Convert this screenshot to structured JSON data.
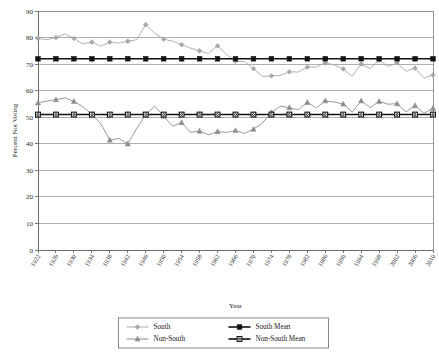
{
  "chart_data": {
    "type": "line",
    "title": "",
    "xlabel": "Year",
    "ylabel": "Percent Not Voting",
    "ylim": [
      0,
      90
    ],
    "ytick_step": 10,
    "yticks": [
      0,
      10,
      20,
      30,
      40,
      50,
      60,
      70,
      80,
      90
    ],
    "grid": true,
    "legend_position": "bottom",
    "xlim": [
      1922,
      2010
    ],
    "x": [
      1922,
      1924,
      1926,
      1928,
      1930,
      1932,
      1934,
      1936,
      1938,
      1940,
      1942,
      1944,
      1946,
      1948,
      1950,
      1952,
      1954,
      1956,
      1958,
      1960,
      1962,
      1964,
      1966,
      1968,
      1970,
      1972,
      1974,
      1976,
      1978,
      1980,
      1982,
      1984,
      1986,
      1988,
      1990,
      1992,
      1994,
      1996,
      1998,
      2000,
      2002,
      2004,
      2006,
      2008,
      2010
    ],
    "xtick_labels": [
      "1922",
      "1926",
      "1930",
      "1934",
      "1938",
      "1942",
      "1946",
      "1950",
      "1954",
      "1958",
      "1962",
      "1966",
      "1970",
      "1974",
      "1978",
      "1982",
      "1986",
      "1990",
      "1994",
      "1998",
      "2002",
      "2006",
      "2010"
    ],
    "series": [
      {
        "name": "South",
        "color": "#a8a8a8",
        "marker": "diamond",
        "values": [
          79.6,
          79.2,
          80.0,
          81.4,
          79.7,
          77.6,
          78.3,
          76.7,
          78.3,
          77.9,
          78.6,
          79.2,
          84.9,
          81.6,
          79.4,
          78.6,
          77.3,
          76.0,
          75.0,
          74.0,
          76.9,
          73.7,
          71.1,
          70.9,
          68.3,
          65.3,
          65.6,
          65.7,
          67.1,
          67.0,
          68.9,
          68.9,
          70.5,
          69.7,
          68.2,
          65.4,
          70.0,
          68.3,
          71.5,
          69.1,
          70.5,
          67.3,
          68.5,
          64.8,
          65.9
        ]
      },
      {
        "name": "South Mean",
        "color": "#111111",
        "marker": "square",
        "values": [
          72.0,
          72.0,
          72.0,
          72.0,
          72.0,
          72.0,
          72.0,
          72.0,
          72.0,
          72.0,
          72.0,
          72.0,
          72.0,
          72.0,
          72.0,
          72.0,
          72.0,
          72.0,
          72.0,
          72.0,
          72.0,
          72.0,
          72.0,
          72.0,
          72.0,
          72.0,
          72.0,
          72.0,
          72.0,
          72.0,
          72.0,
          72.0,
          72.0,
          72.0,
          72.0,
          72.0,
          72.0,
          72.0,
          72.0,
          72.0,
          72.0,
          72.0,
          72.0,
          72.0,
          72.0
        ]
      },
      {
        "name": "Non-South",
        "color": "#8d8d8d",
        "marker": "triangle",
        "values": [
          55.4,
          56.1,
          56.6,
          57.3,
          56.0,
          54.0,
          51.0,
          47.5,
          41.4,
          42.0,
          40.0,
          45.8,
          51.0,
          54.2,
          50.4,
          46.6,
          48.0,
          44.3,
          44.8,
          43.4,
          44.6,
          44.3,
          45.0,
          43.9,
          45.5,
          47.8,
          51.8,
          54.2,
          53.6,
          52.8,
          55.6,
          53.5,
          56.2,
          55.7,
          55.0,
          51.9,
          56.2,
          53.6,
          56.0,
          54.9,
          55.1,
          52.0,
          54.4,
          51.5,
          53.4
        ]
      },
      {
        "name": "Non-South Mean",
        "color": "#111111",
        "marker": "circle-square",
        "values": [
          51.0,
          51.0,
          51.0,
          51.0,
          51.0,
          51.0,
          51.0,
          51.0,
          51.0,
          51.0,
          51.0,
          51.0,
          51.0,
          51.0,
          51.0,
          51.0,
          51.0,
          51.0,
          51.0,
          51.0,
          51.0,
          51.0,
          51.0,
          51.0,
          51.0,
          51.0,
          51.0,
          51.0,
          51.0,
          51.0,
          51.0,
          51.0,
          51.0,
          51.0,
          51.0,
          51.0,
          51.0,
          51.0,
          51.0,
          51.0,
          51.0,
          51.0,
          51.0,
          51.0,
          51.0
        ]
      }
    ],
    "legend": [
      {
        "label": "South",
        "color": "#a8a8a8",
        "marker": "diamond"
      },
      {
        "label": "South Mean",
        "color": "#111111",
        "marker": "square"
      },
      {
        "label": "Non-South",
        "color": "#8d8d8d",
        "marker": "triangle"
      },
      {
        "label": "Non-South Mean",
        "color": "#111111",
        "marker": "circle-square"
      }
    ]
  }
}
